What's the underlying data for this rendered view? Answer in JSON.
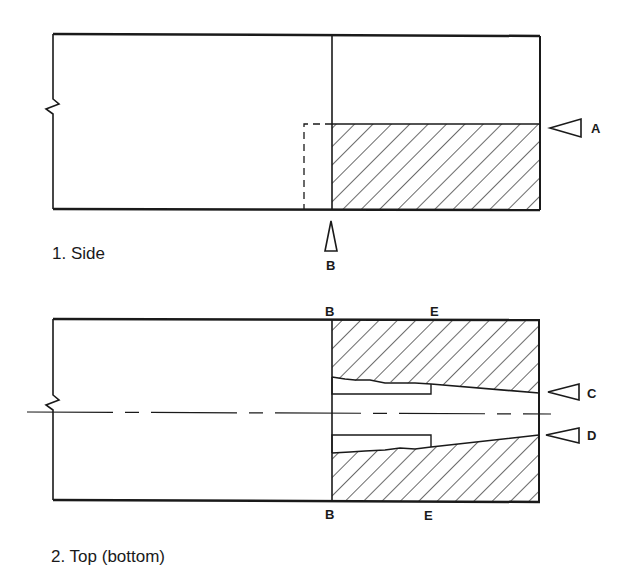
{
  "figure": {
    "views": [
      {
        "id": "side",
        "caption": "1. Side",
        "markers": [
          {
            "label": "A",
            "direction": "left",
            "description": "section arrow at level of hatched region top"
          },
          {
            "label": "B",
            "direction": "up",
            "description": "section arrow at joint line"
          }
        ]
      },
      {
        "id": "top",
        "caption": "2. Top (bottom)",
        "markers": [
          {
            "label": "B",
            "position": "top-of-joint-line"
          },
          {
            "label": "E",
            "position": "top-middle"
          },
          {
            "label": "C",
            "direction": "left",
            "description": "arrow at upper tapered edge"
          },
          {
            "label": "D",
            "direction": "left",
            "description": "arrow at lower tapered edge"
          },
          {
            "label": "B",
            "position": "bottom-of-joint-line"
          },
          {
            "label": "E",
            "position": "bottom-middle"
          }
        ]
      }
    ],
    "colors": {
      "ink": "#1a1a1a",
      "background": "#ffffff"
    }
  },
  "labels": {
    "side_caption": "1. Side",
    "top_caption": "2. Top (bottom)",
    "A": "A",
    "B": "B",
    "C": "C",
    "D": "D",
    "E": "E"
  }
}
